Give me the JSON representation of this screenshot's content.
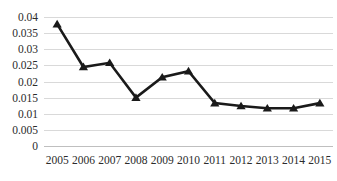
{
  "chart_data": {
    "type": "line",
    "title": "",
    "subtitle": "",
    "xlabel": "",
    "ylabel": "",
    "categories": [
      "2005",
      "2006",
      "2007",
      "2008",
      "2009",
      "2010",
      "2011",
      "2012",
      "2013",
      "2014",
      "2015"
    ],
    "x": [
      2005,
      2006,
      2007,
      2008,
      2009,
      2010,
      2011,
      2012,
      2013,
      2014,
      2015
    ],
    "values": [
      0.0378,
      0.0245,
      0.0258,
      0.015,
      0.0213,
      0.0232,
      0.0133,
      0.0124,
      0.0117,
      0.0117,
      0.0133
    ],
    "series": [
      {
        "name": "",
        "values": [
          0.0378,
          0.0245,
          0.0258,
          0.015,
          0.0213,
          0.0232,
          0.0133,
          0.0124,
          0.0117,
          0.0117,
          0.0133
        ],
        "color": "#1a1a1a",
        "marker": "triangle"
      }
    ],
    "ylim": [
      0,
      0.04
    ],
    "ytick_values": [
      0,
      0.005,
      0.01,
      0.015,
      0.02,
      0.025,
      0.03,
      0.035,
      0.04
    ],
    "ytick_labels": [
      "0",
      "0.005",
      "0.01",
      "0.015",
      "0.02",
      "0.025",
      "0.03",
      "0.035",
      "0.04"
    ],
    "xtick_labels": [
      "2005",
      "2006",
      "2007",
      "2008",
      "2009",
      "2010",
      "2011",
      "2012",
      "2013",
      "2014",
      "2015"
    ],
    "grid": true,
    "grid_axis": "y",
    "grid_color": "#d9d9d9",
    "legend": false,
    "legend_position": "none",
    "annotations": [],
    "background_color": "#ffffff",
    "line_color": "#1a1a1a"
  }
}
